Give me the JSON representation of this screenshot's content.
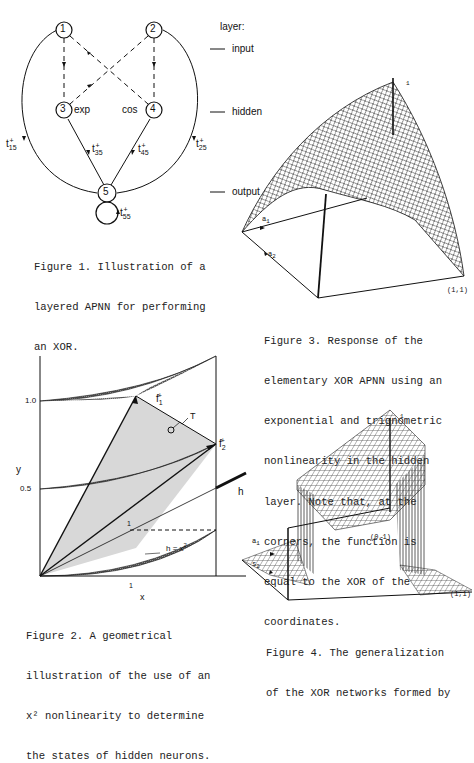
{
  "figure1": {
    "nodes": [
      {
        "id": "1",
        "label": "1"
      },
      {
        "id": "2",
        "label": "2"
      },
      {
        "id": "3",
        "label": "3",
        "nonlinearity": "exp"
      },
      {
        "id": "4",
        "label": "4",
        "nonlinearity": "cos"
      },
      {
        "id": "5",
        "label": "5"
      }
    ],
    "edge_labels": {
      "t15": "t",
      "t15_sub": "15",
      "t25": "t",
      "t25_sub": "25",
      "t35": "t",
      "t35_sub": "35",
      "t45": "t",
      "t45_sub": "45",
      "t55": "t",
      "t55_sub": "55",
      "sup": "+"
    },
    "layer_heading": "layer:",
    "layers": [
      "input",
      "hidden",
      "output"
    ],
    "caption": [
      "Figure 1. Illustration of a",
      "layered APNN for performing",
      "an XOR."
    ]
  },
  "figure2": {
    "y_label": "y",
    "x_label": "x",
    "y_ticks": [
      "1.0",
      "0.5"
    ],
    "x_tick": "1",
    "inner_tick": "1",
    "labels": {
      "f1": "f",
      "f1_sub": "1",
      "f2": "f",
      "f2_sub": "2",
      "sup": "+",
      "T": "T",
      "h": "h",
      "curve": "h = x"
    },
    "caption": [
      "Figure 2. A geometrical",
      "illustration of the use of an",
      "x² nonlinearity to determine",
      "the states of hidden neurons."
    ]
  },
  "figure3": {
    "labels": {
      "top": "1",
      "a1": "a",
      "a1_sub": "1",
      "a2": "a",
      "a2_sub": "2",
      "corner": "(1,1)"
    },
    "caption": [
      "Figure 3. Response of the",
      "elementary XOR APNN using an",
      "exponential and trignometric",
      "nonlinearity in the hidden",
      "layer. Note that, at the",
      "corners, the function is",
      "equal to the XOR of the",
      "coordinates."
    ]
  },
  "figure4": {
    "labels": {
      "top": "1",
      "a1": "a",
      "a1_sub": "1",
      "a2": "s",
      "a2_sub": "2",
      "corner01": "(0,1)",
      "corner11": "(1,1)"
    },
    "caption": [
      "Figure 4. The generalization",
      "of the XOR networks formed by"
    ]
  }
}
